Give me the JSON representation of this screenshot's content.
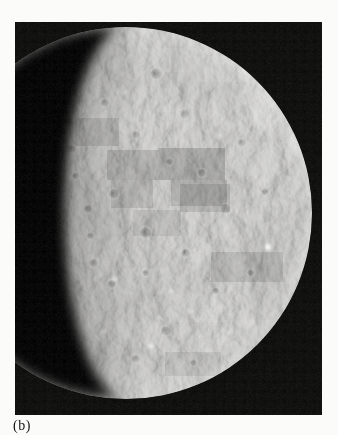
{
  "page": {
    "background": "#fbfbf9"
  },
  "figure": {
    "caption": "(b)",
    "photo": {
      "subject": "mercury-photomosaic",
      "background": "#0b0b0a",
      "planet_base": "#8f8f8d",
      "lighting": "#d6d5d2",
      "shadow": "#030303",
      "caption_color": "#141414"
    }
  }
}
